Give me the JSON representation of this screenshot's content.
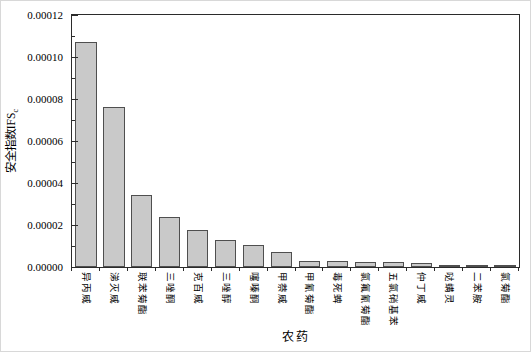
{
  "chart_data": {
    "type": "bar",
    "title": "",
    "xlabel": "农药",
    "ylabel": "安全指数IFS",
    "ylabel_subscript": "c",
    "categories": [
      "异丙威",
      "涕灭威",
      "联苯菊酯",
      "三唑酮",
      "克百威",
      "三唑醇",
      "噻嗪酮",
      "甲萘威",
      "甲氰菊酯",
      "毒死蜱",
      "氯氟氰菊酯",
      "五氯硝基苯",
      "仲丁威",
      "哒螨灵",
      "二苯胺",
      "氯菊酯"
    ],
    "values": [
      0.000107,
      7.6e-05,
      3.45e-05,
      2.37e-05,
      1.76e-05,
      1.28e-05,
      1.04e-05,
      7.2e-06,
      2.7e-06,
      2.7e-06,
      2.6e-06,
      2.4e-06,
      1.9e-06,
      9e-07,
      7e-07,
      6e-07
    ],
    "ylim": [
      0,
      0.00012
    ],
    "ytick_step": 2e-05,
    "ytick_labels": [
      "0.00000",
      "0.00002",
      "0.00004",
      "0.00006",
      "0.00008",
      "0.00010",
      "0.00012"
    ],
    "yminor_step": 1e-05,
    "grid": false,
    "legend": "none",
    "bar_fill": "#c9c9c9",
    "bar_stroke": "#4f4f4f",
    "axis_color": "#2b2b2b"
  }
}
